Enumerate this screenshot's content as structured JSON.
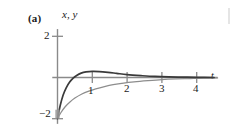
{
  "figure": {
    "panel_label": "(a)",
    "vertical_axis_label": "x, y",
    "horizontal_axis_label": "t",
    "ticks": {
      "x_labels": [
        "1",
        "2",
        "3",
        "4"
      ],
      "y_labels": [
        "2",
        "−2"
      ]
    },
    "colors": {
      "curve_dark": "#3a3a3a",
      "curve_light": "#8d8d8d",
      "axis": "#8a8a8a",
      "text": "#1a1a1a"
    }
  },
  "chart_data": {
    "type": "line",
    "title": "",
    "xlabel": "t",
    "ylabel": "x, y",
    "xlim": [
      -0.15,
      4.6
    ],
    "ylim": [
      -2.25,
      2.35
    ],
    "xticks": [
      1,
      2,
      3,
      4
    ],
    "yticks": [
      2,
      -2
    ],
    "grid": false,
    "legend": "none",
    "series": [
      {
        "name": "x",
        "color": "#3a3a3a",
        "points": [
          [
            0.0,
            -2.0
          ],
          [
            0.08,
            -1.35
          ],
          [
            0.16,
            -0.86
          ],
          [
            0.25,
            -0.5
          ],
          [
            0.35,
            -0.22
          ],
          [
            0.45,
            -0.03
          ],
          [
            0.55,
            0.1
          ],
          [
            0.68,
            0.21
          ],
          [
            0.82,
            0.27
          ],
          [
            1.0,
            0.3
          ],
          [
            1.2,
            0.29
          ],
          [
            1.45,
            0.25
          ],
          [
            1.7,
            0.2
          ],
          [
            2.0,
            0.14
          ],
          [
            2.4,
            0.09
          ],
          [
            2.8,
            0.05
          ],
          [
            3.2,
            0.03
          ],
          [
            3.6,
            0.02
          ],
          [
            4.0,
            0.01
          ],
          [
            4.5,
            0.0
          ]
        ]
      },
      {
        "name": "y",
        "color": "#8d8d8d",
        "points": [
          [
            0.0,
            -2.0
          ],
          [
            0.1,
            -1.7
          ],
          [
            0.22,
            -1.42
          ],
          [
            0.35,
            -1.2
          ],
          [
            0.5,
            -1.0
          ],
          [
            0.7,
            -0.8
          ],
          [
            0.9,
            -0.66
          ],
          [
            1.1,
            -0.55
          ],
          [
            1.35,
            -0.44
          ],
          [
            1.6,
            -0.35
          ],
          [
            1.9,
            -0.27
          ],
          [
            2.2,
            -0.21
          ],
          [
            2.6,
            -0.15
          ],
          [
            3.0,
            -0.1
          ],
          [
            3.4,
            -0.07
          ],
          [
            3.8,
            -0.05
          ],
          [
            4.2,
            -0.03
          ],
          [
            4.6,
            -0.02
          ]
        ]
      }
    ]
  }
}
